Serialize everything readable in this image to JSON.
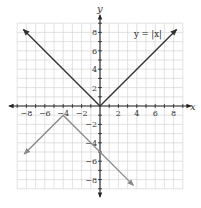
{
  "chart_data": {
    "type": "line",
    "title": "",
    "xlabel": "x",
    "ylabel": "y",
    "xlim": [
      -9,
      9
    ],
    "ylim": [
      -9,
      9
    ],
    "grid": true,
    "x_ticks": [
      -8,
      -6,
      -4,
      -2,
      2,
      4,
      6,
      8
    ],
    "y_ticks": [
      8,
      6,
      4,
      2,
      -2,
      -4,
      -6,
      -8
    ],
    "x_tick_labels": [
      "−8",
      "−6",
      "−4",
      "−2",
      "2",
      "4",
      "6",
      "8"
    ],
    "y_tick_labels": [
      "8",
      "6",
      "4",
      "2",
      "−2",
      "−4",
      "−6",
      "−8"
    ],
    "series": [
      {
        "name": "y = |x|",
        "color": "#333333",
        "points": [
          [
            -8.3,
            8.3
          ],
          [
            0,
            0
          ],
          [
            8.3,
            8.3
          ]
        ],
        "arrows": true,
        "label": "y = |x|"
      },
      {
        "name": "transformed",
        "color": "#8a8a8a",
        "points": [
          [
            -8.2,
            -5.2
          ],
          [
            -4,
            -1
          ],
          [
            3.6,
            -8.6
          ]
        ],
        "arrows": true,
        "label": ""
      }
    ],
    "annotations": [
      {
        "text": "y = |x|",
        "x": 5.8,
        "y": 7.5
      }
    ]
  },
  "labels": {
    "x_axis": "x",
    "y_axis": "y",
    "equation": "y = |x|"
  }
}
